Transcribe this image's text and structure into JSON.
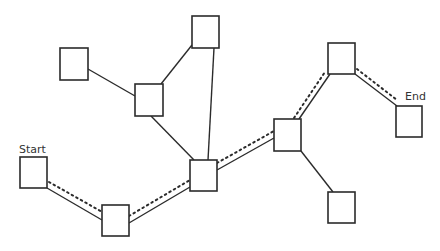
{
  "diagram": {
    "title": "",
    "labels": {
      "start": "Start",
      "end": "End"
    },
    "nodes": [
      {
        "id": "start",
        "x": 20,
        "y": 157,
        "w": 27,
        "h": 31
      },
      {
        "id": "n_bottom_left",
        "x": 102,
        "y": 205,
        "w": 27,
        "h": 31
      },
      {
        "id": "n_center",
        "x": 190,
        "y": 160,
        "w": 27,
        "h": 31
      },
      {
        "id": "n_top_left",
        "x": 60,
        "y": 48,
        "w": 28,
        "h": 32
      },
      {
        "id": "n_mid_left",
        "x": 135,
        "y": 84,
        "w": 28,
        "h": 32
      },
      {
        "id": "n_top",
        "x": 192,
        "y": 16,
        "w": 27,
        "h": 32
      },
      {
        "id": "n_right_mid",
        "x": 274,
        "y": 119,
        "w": 27,
        "h": 32
      },
      {
        "id": "n_bottom_right",
        "x": 328,
        "y": 192,
        "w": 27,
        "h": 31
      },
      {
        "id": "n_top_right",
        "x": 328,
        "y": 43,
        "w": 27,
        "h": 31
      },
      {
        "id": "end",
        "x": 396,
        "y": 106,
        "w": 26,
        "h": 31
      }
    ],
    "edges": [
      {
        "from": "start",
        "to": "n_bottom_left",
        "x1": 47,
        "y1": 188,
        "x2": 102,
        "y2": 220
      },
      {
        "from": "n_bottom_left",
        "to": "n_center",
        "x1": 129,
        "y1": 223,
        "x2": 190,
        "y2": 187
      },
      {
        "from": "n_top_left",
        "to": "n_mid_left",
        "x1": 88,
        "y1": 69,
        "x2": 135,
        "y2": 96
      },
      {
        "from": "n_mid_left",
        "to": "n_top",
        "x1": 161,
        "y1": 84,
        "x2": 192,
        "y2": 45
      },
      {
        "from": "n_mid_left",
        "to": "n_center",
        "x1": 151,
        "y1": 116,
        "x2": 194,
        "y2": 160
      },
      {
        "from": "n_top",
        "to": "n_center",
        "x1": 214,
        "y1": 48,
        "x2": 208,
        "y2": 160
      },
      {
        "from": "n_center",
        "to": "n_right_mid",
        "x1": 217,
        "y1": 170,
        "x2": 274,
        "y2": 138
      },
      {
        "from": "n_right_mid",
        "to": "n_top_right",
        "x1": 299,
        "y1": 119,
        "x2": 330,
        "y2": 74
      },
      {
        "from": "n_right_mid",
        "to": "n_bottom_right",
        "x1": 301,
        "y1": 151,
        "x2": 333,
        "y2": 192
      },
      {
        "from": "n_top_right",
        "to": "end",
        "x1": 355,
        "y1": 74,
        "x2": 397,
        "y2": 106
      }
    ],
    "highlighted_path": {
      "style": "dotted",
      "node_sequence": [
        "start",
        "n_bottom_left",
        "n_center",
        "n_right_mid",
        "n_top_right",
        "end"
      ],
      "segments": [
        {
          "x1": 49,
          "y1": 182,
          "x2": 104,
          "y2": 213
        },
        {
          "x1": 129,
          "y1": 216,
          "x2": 190,
          "y2": 180
        },
        {
          "x1": 217,
          "y1": 163,
          "x2": 274,
          "y2": 131
        },
        {
          "x1": 294,
          "y1": 118,
          "x2": 325,
          "y2": 72
        },
        {
          "x1": 357,
          "y1": 69,
          "x2": 397,
          "y2": 100
        }
      ]
    }
  }
}
